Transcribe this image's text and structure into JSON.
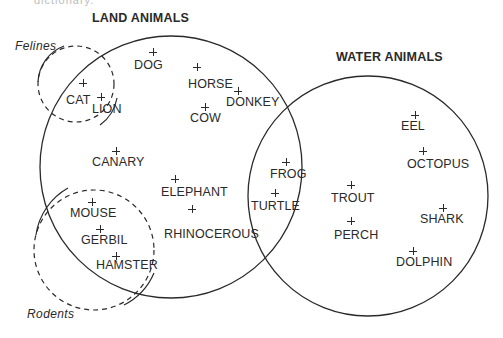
{
  "diagram": {
    "type": "venn",
    "truncated_top_text": "dictionary.",
    "sets": {
      "land": {
        "title": "LAND ANIMALS",
        "cx": 171,
        "cy": 167,
        "r": 131,
        "style": "solid"
      },
      "water": {
        "title": "WATER ANIMALS",
        "cx": 368,
        "cy": 196,
        "r": 120,
        "style": "solid"
      },
      "felines": {
        "title": "Felines",
        "cx": 76,
        "cy": 84,
        "r": 38,
        "style": "dashed"
      },
      "rodents": {
        "title": "Rodents",
        "cx": 94,
        "cy": 250,
        "r": 60,
        "style": "dashed"
      }
    },
    "items": [
      {
        "name": "DOG",
        "px": 153,
        "py": 52,
        "tx": 134,
        "ty": 59,
        "sets": [
          "land"
        ]
      },
      {
        "name": "HORSE",
        "px": 197,
        "py": 67,
        "tx": 188,
        "ty": 78,
        "sets": [
          "land"
        ]
      },
      {
        "name": "DONKEY",
        "px": 238,
        "py": 91,
        "tx": 226,
        "ty": 96,
        "sets": [
          "land"
        ]
      },
      {
        "name": "COW",
        "px": 205,
        "py": 107,
        "tx": 190,
        "ty": 112,
        "sets": [
          "land"
        ]
      },
      {
        "name": "CAT",
        "px": 83,
        "py": 83,
        "tx": 66,
        "ty": 94,
        "sets": [
          "land",
          "felines"
        ]
      },
      {
        "name": "LION",
        "px": 101,
        "py": 97,
        "tx": 92,
        "ty": 103,
        "sets": [
          "land",
          "felines"
        ]
      },
      {
        "name": "CANARY",
        "px": 116,
        "py": 151,
        "tx": 92,
        "ty": 156,
        "sets": [
          "land"
        ]
      },
      {
        "name": "ELEPHANT",
        "px": 175,
        "py": 179,
        "tx": 161,
        "ty": 186,
        "sets": [
          "land"
        ]
      },
      {
        "name": "RHINOCEROUS",
        "px": 192,
        "py": 209,
        "tx": 164,
        "ty": 228,
        "sets": [
          "land"
        ]
      },
      {
        "name": "MOUSE",
        "px": 92,
        "py": 202,
        "tx": 70,
        "ty": 207,
        "sets": [
          "land",
          "rodents"
        ]
      },
      {
        "name": "GERBIL",
        "px": 100,
        "py": 229,
        "tx": 81,
        "ty": 234,
        "sets": [
          "land",
          "rodents"
        ]
      },
      {
        "name": "HAMSTER",
        "px": 116,
        "py": 256,
        "tx": 96,
        "ty": 259,
        "sets": [
          "land",
          "rodents"
        ]
      },
      {
        "name": "FROG",
        "px": 286,
        "py": 162,
        "tx": 270,
        "ty": 168,
        "sets": [
          "land",
          "water"
        ]
      },
      {
        "name": "TURTLE",
        "px": 275,
        "py": 193,
        "tx": 251,
        "ty": 200,
        "sets": [
          "land",
          "water"
        ]
      },
      {
        "name": "TROUT",
        "px": 351,
        "py": 185,
        "tx": 331,
        "ty": 192,
        "sets": [
          "water"
        ]
      },
      {
        "name": "PERCH",
        "px": 351,
        "py": 221,
        "tx": 334,
        "ty": 229,
        "sets": [
          "water"
        ]
      },
      {
        "name": "EEL",
        "px": 415,
        "py": 115,
        "tx": 401,
        "ty": 120,
        "sets": [
          "water"
        ]
      },
      {
        "name": "OCTOPUS",
        "px": 423,
        "py": 151,
        "tx": 407,
        "ty": 158,
        "sets": [
          "water"
        ]
      },
      {
        "name": "SHARK",
        "px": 443,
        "py": 208,
        "tx": 420,
        "ty": 213,
        "sets": [
          "water"
        ]
      },
      {
        "name": "DOLPHIN",
        "px": 413,
        "py": 251,
        "tx": 396,
        "ty": 256,
        "sets": [
          "water"
        ]
      }
    ],
    "colors": {
      "ink": "#2a2a2a",
      "background": "#ffffff"
    }
  }
}
